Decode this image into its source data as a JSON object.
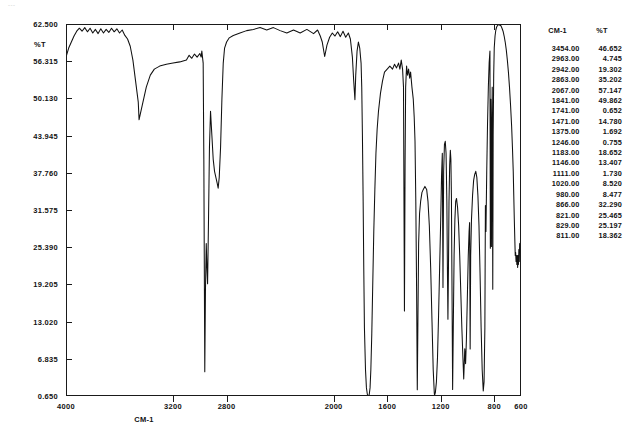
{
  "artifact_text": "---",
  "axes": {
    "y_title": "%T",
    "x_title": "CM-1",
    "y_ticks": [
      "62.500",
      "56.315",
      "50.130",
      "43.945",
      "37.760",
      "31.575",
      "25.390",
      "19.205",
      "13.020",
      "6.835",
      "0.650"
    ],
    "x_ticks": [
      "4000",
      "3200",
      "2800",
      "2000",
      "1600",
      "1200",
      "800",
      "600"
    ]
  },
  "table": {
    "header_wavenumber": "CM-1",
    "header_transmittance": "%T",
    "rows": [
      {
        "cm": "3454.00",
        "t": "46.652"
      },
      {
        "cm": "2963.00",
        "t": "4.745"
      },
      {
        "cm": "2942.00",
        "t": "19.302"
      },
      {
        "cm": "2863.00",
        "t": "35.202"
      },
      {
        "cm": "2067.00",
        "t": "57.147"
      },
      {
        "cm": "1841.00",
        "t": "49.862"
      },
      {
        "cm": "1741.00",
        "t": "0.652"
      },
      {
        "cm": "1471.00",
        "t": "14.780"
      },
      {
        "cm": "1375.00",
        "t": "1.692"
      },
      {
        "cm": "1246.00",
        "t": "0.755"
      },
      {
        "cm": "1183.00",
        "t": "18.652"
      },
      {
        "cm": "1146.00",
        "t": "13.407"
      },
      {
        "cm": "1111.00",
        "t": "1.730"
      },
      {
        "cm": "1020.00",
        "t": "8.520"
      },
      {
        "cm": "980.00",
        "t": "8.477"
      },
      {
        "cm": "866.00",
        "t": "32.290"
      },
      {
        "cm": "821.00",
        "t": "25.465"
      },
      {
        "cm": "829.00",
        "t": "25.197"
      },
      {
        "cm": "811.00",
        "t": "18.362"
      }
    ]
  },
  "chart_data": {
    "type": "line",
    "title": "",
    "xlabel": "CM-1",
    "ylabel": "%T",
    "xlim": [
      4000,
      600
    ],
    "ylim": [
      0.65,
      62.5
    ],
    "x_reversed": true,
    "grid": false,
    "legend": "none",
    "annotations": [],
    "series": [
      {
        "name": "transmittance",
        "points": [
          [
            4000,
            57.0
          ],
          [
            3980,
            58.5
          ],
          [
            3960,
            59.5
          ],
          [
            3940,
            60.5
          ],
          [
            3920,
            61.3
          ],
          [
            3900,
            61.8
          ],
          [
            3880,
            61.3
          ],
          [
            3860,
            61.9
          ],
          [
            3840,
            61.2
          ],
          [
            3820,
            61.8
          ],
          [
            3800,
            61.0
          ],
          [
            3780,
            61.6
          ],
          [
            3760,
            60.9
          ],
          [
            3740,
            61.7
          ],
          [
            3720,
            61.0
          ],
          [
            3700,
            61.6
          ],
          [
            3680,
            61.1
          ],
          [
            3660,
            61.8
          ],
          [
            3640,
            61.2
          ],
          [
            3620,
            61.7
          ],
          [
            3600,
            61.0
          ],
          [
            3580,
            61.5
          ],
          [
            3560,
            60.6
          ],
          [
            3540,
            60.0
          ],
          [
            3520,
            58.8
          ],
          [
            3500,
            56.5
          ],
          [
            3480,
            53.0
          ],
          [
            3460,
            49.5
          ],
          [
            3454,
            46.6
          ],
          [
            3430,
            49.0
          ],
          [
            3400,
            52.0
          ],
          [
            3370,
            54.0
          ],
          [
            3340,
            55.0
          ],
          [
            3300,
            55.5
          ],
          [
            3250,
            55.8
          ],
          [
            3200,
            56.0
          ],
          [
            3150,
            56.2
          ],
          [
            3100,
            56.5
          ],
          [
            3080,
            57.3
          ],
          [
            3060,
            56.8
          ],
          [
            3040,
            57.5
          ],
          [
            3020,
            57.0
          ],
          [
            3000,
            57.6
          ],
          [
            2990,
            57.0
          ],
          [
            2985,
            58.0
          ],
          [
            2980,
            57.0
          ],
          [
            2975,
            56.0
          ],
          [
            2970,
            40.0
          ],
          [
            2963,
            4.7
          ],
          [
            2958,
            18.0
          ],
          [
            2952,
            26.0
          ],
          [
            2947,
            22.0
          ],
          [
            2942,
            19.3
          ],
          [
            2935,
            30.0
          ],
          [
            2928,
            42.0
          ],
          [
            2920,
            48.0
          ],
          [
            2910,
            44.0
          ],
          [
            2900,
            40.0
          ],
          [
            2890,
            38.0
          ],
          [
            2880,
            37.0
          ],
          [
            2870,
            36.0
          ],
          [
            2863,
            35.2
          ],
          [
            2855,
            37.0
          ],
          [
            2845,
            42.0
          ],
          [
            2835,
            50.0
          ],
          [
            2825,
            56.0
          ],
          [
            2815,
            58.5
          ],
          [
            2800,
            59.5
          ],
          [
            2780,
            60.2
          ],
          [
            2750,
            60.6
          ],
          [
            2700,
            61.0
          ],
          [
            2650,
            61.4
          ],
          [
            2600,
            61.6
          ],
          [
            2550,
            61.9
          ],
          [
            2500,
            61.5
          ],
          [
            2450,
            61.9
          ],
          [
            2400,
            61.4
          ],
          [
            2350,
            61.0
          ],
          [
            2300,
            61.5
          ],
          [
            2250,
            61.0
          ],
          [
            2200,
            61.6
          ],
          [
            2150,
            60.9
          ],
          [
            2120,
            61.5
          ],
          [
            2100,
            60.5
          ],
          [
            2085,
            59.5
          ],
          [
            2067,
            57.1
          ],
          [
            2050,
            59.0
          ],
          [
            2030,
            60.3
          ],
          [
            2010,
            61.0
          ],
          [
            1990,
            60.5
          ],
          [
            1970,
            61.2
          ],
          [
            1950,
            60.4
          ],
          [
            1930,
            61.3
          ],
          [
            1910,
            60.3
          ],
          [
            1890,
            61.0
          ],
          [
            1875,
            60.0
          ],
          [
            1860,
            57.0
          ],
          [
            1850,
            53.0
          ],
          [
            1841,
            49.9
          ],
          [
            1835,
            54.0
          ],
          [
            1825,
            58.0
          ],
          [
            1815,
            59.5
          ],
          [
            1805,
            58.5
          ],
          [
            1795,
            56.0
          ],
          [
            1790,
            52.0
          ],
          [
            1785,
            44.0
          ],
          [
            1780,
            34.0
          ],
          [
            1775,
            22.0
          ],
          [
            1770,
            12.0
          ],
          [
            1762,
            5.0
          ],
          [
            1755,
            2.0
          ],
          [
            1748,
            0.9
          ],
          [
            1741,
            0.65
          ],
          [
            1734,
            0.9
          ],
          [
            1728,
            2.0
          ],
          [
            1722,
            5.0
          ],
          [
            1715,
            11.0
          ],
          [
            1708,
            19.0
          ],
          [
            1700,
            28.0
          ],
          [
            1692,
            35.0
          ],
          [
            1684,
            41.0
          ],
          [
            1675,
            45.0
          ],
          [
            1665,
            48.0
          ],
          [
            1650,
            51.0
          ],
          [
            1635,
            53.0
          ],
          [
            1620,
            54.5
          ],
          [
            1600,
            55.0
          ],
          [
            1580,
            55.5
          ],
          [
            1560,
            55.0
          ],
          [
            1545,
            55.8
          ],
          [
            1530,
            55.2
          ],
          [
            1515,
            56.0
          ],
          [
            1505,
            55.0
          ],
          [
            1495,
            56.5
          ],
          [
            1485,
            55.0
          ],
          [
            1478,
            52.0
          ],
          [
            1471,
            14.8
          ],
          [
            1466,
            40.0
          ],
          [
            1462,
            52.0
          ],
          [
            1455,
            55.5
          ],
          [
            1448,
            54.0
          ],
          [
            1440,
            55.0
          ],
          [
            1432,
            53.5
          ],
          [
            1425,
            54.5
          ],
          [
            1415,
            52.0
          ],
          [
            1405,
            50.0
          ],
          [
            1398,
            47.0
          ],
          [
            1392,
            43.0
          ],
          [
            1386,
            33.0
          ],
          [
            1380,
            18.0
          ],
          [
            1375,
            1.7
          ],
          [
            1370,
            14.0
          ],
          [
            1365,
            26.0
          ],
          [
            1358,
            31.0
          ],
          [
            1350,
            33.0
          ],
          [
            1340,
            34.5
          ],
          [
            1330,
            35.0
          ],
          [
            1318,
            35.5
          ],
          [
            1305,
            35.0
          ],
          [
            1295,
            33.0
          ],
          [
            1285,
            29.0
          ],
          [
            1275,
            22.0
          ],
          [
            1265,
            13.0
          ],
          [
            1256,
            5.0
          ],
          [
            1248,
            1.2
          ],
          [
            1246,
            0.76
          ],
          [
            1240,
            1.2
          ],
          [
            1232,
            3.0
          ],
          [
            1224,
            7.0
          ],
          [
            1216,
            14.0
          ],
          [
            1208,
            22.0
          ],
          [
            1200,
            30.0
          ],
          [
            1194,
            37.0
          ],
          [
            1188,
            41.0
          ],
          [
            1183,
            18.7
          ],
          [
            1178,
            38.0
          ],
          [
            1172,
            42.5
          ],
          [
            1166,
            43.0
          ],
          [
            1160,
            41.0
          ],
          [
            1154,
            33.0
          ],
          [
            1150,
            22.0
          ],
          [
            1146,
            13.4
          ],
          [
            1142,
            22.0
          ],
          [
            1138,
            33.0
          ],
          [
            1133,
            39.0
          ],
          [
            1128,
            41.5
          ],
          [
            1124,
            40.0
          ],
          [
            1120,
            34.0
          ],
          [
            1116,
            20.0
          ],
          [
            1111,
            1.73
          ],
          [
            1106,
            12.0
          ],
          [
            1100,
            24.0
          ],
          [
            1094,
            30.0
          ],
          [
            1088,
            33.0
          ],
          [
            1082,
            33.5
          ],
          [
            1074,
            32.0
          ],
          [
            1066,
            29.0
          ],
          [
            1058,
            24.0
          ],
          [
            1050,
            18.0
          ],
          [
            1042,
            12.0
          ],
          [
            1034,
            7.0
          ],
          [
            1028,
            3.5
          ],
          [
            1020,
            8.5
          ],
          [
            1014,
            6.0
          ],
          [
            1008,
            10.0
          ],
          [
            1000,
            18.0
          ],
          [
            994,
            24.0
          ],
          [
            988,
            28.0
          ],
          [
            984,
            29.5
          ],
          [
            980,
            8.48
          ],
          [
            976,
            24.0
          ],
          [
            970,
            30.0
          ],
          [
            962,
            34.0
          ],
          [
            954,
            36.5
          ],
          [
            946,
            37.5
          ],
          [
            938,
            38.0
          ],
          [
            930,
            37.0
          ],
          [
            922,
            34.0
          ],
          [
            914,
            29.0
          ],
          [
            906,
            21.0
          ],
          [
            898,
            12.0
          ],
          [
            890,
            5.0
          ],
          [
            882,
            1.5
          ],
          [
            876,
            3.0
          ],
          [
            870,
            12.0
          ],
          [
            866,
            32.3
          ],
          [
            862,
            28.0
          ],
          [
            856,
            38.0
          ],
          [
            850,
            46.0
          ],
          [
            844,
            52.0
          ],
          [
            838,
            56.0
          ],
          [
            832,
            58.0
          ],
          [
            829,
            25.2
          ],
          [
            826,
            50.0
          ],
          [
            823,
            40.0
          ],
          [
            821,
            25.5
          ],
          [
            818,
            45.0
          ],
          [
            815,
            52.0
          ],
          [
            811,
            18.4
          ],
          [
            808,
            44.0
          ],
          [
            804,
            54.0
          ],
          [
            800,
            58.5
          ],
          [
            794,
            60.5
          ],
          [
            788,
            61.5
          ],
          [
            782,
            62.0
          ],
          [
            774,
            62.3
          ],
          [
            766,
            62.4
          ],
          [
            758,
            62.3
          ],
          [
            750,
            62.2
          ],
          [
            742,
            61.8
          ],
          [
            734,
            61.3
          ],
          [
            726,
            60.5
          ],
          [
            718,
            59.5
          ],
          [
            710,
            58.2
          ],
          [
            702,
            56.5
          ],
          [
            694,
            54.5
          ],
          [
            686,
            52.0
          ],
          [
            678,
            49.0
          ],
          [
            670,
            45.5
          ],
          [
            664,
            42.0
          ],
          [
            658,
            38.0
          ],
          [
            654,
            34.0
          ],
          [
            650,
            30.0
          ],
          [
            646,
            26.5
          ],
          [
            643,
            24.0
          ],
          [
            640,
            24.5
          ],
          [
            637,
            23.0
          ],
          [
            634,
            24.0
          ],
          [
            631,
            22.5
          ],
          [
            628,
            24.0
          ],
          [
            625,
            22.0
          ],
          [
            622,
            24.0
          ],
          [
            619,
            22.5
          ],
          [
            616,
            25.0
          ],
          [
            613,
            23.0
          ],
          [
            610,
            26.0
          ],
          [
            606,
            25.0
          ],
          [
            603,
            27.0
          ],
          [
            600,
            26.0
          ]
        ]
      }
    ]
  }
}
